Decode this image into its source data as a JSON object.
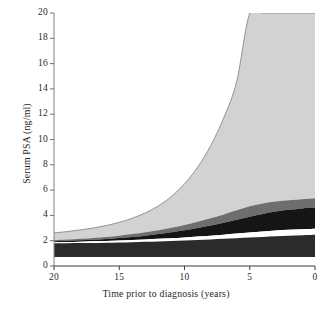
{
  "chart_data": {
    "type": "area",
    "title": "",
    "subtitle": "",
    "xlabel": "Time prior to diagnosis (years)",
    "ylabel": "Serum PSA (ng/ml)",
    "xlim": [
      20,
      0
    ],
    "ylim": [
      0,
      20
    ],
    "x_reversed": true,
    "grid": false,
    "legend": "none",
    "xticks": [
      "20",
      "15",
      "10",
      "5",
      "0"
    ],
    "xtick_values": [
      20,
      15,
      10,
      5,
      0
    ],
    "yticks": [
      "0",
      "2",
      "4",
      "6",
      "8",
      "10",
      "12",
      "14",
      "16",
      "18",
      "20"
    ],
    "ytick_values": [
      0,
      2,
      4,
      6,
      8,
      10,
      12,
      14,
      16,
      18,
      20
    ],
    "x": [
      20,
      19,
      18,
      17,
      16,
      15,
      14,
      13,
      12,
      11,
      10,
      9,
      8,
      7,
      6,
      5,
      4,
      3,
      2,
      1,
      0
    ],
    "series": [
      {
        "name": "upper-extreme-band-top",
        "color": "#d2d2d2",
        "values": [
          2.62,
          2.72,
          2.85,
          3.0,
          3.2,
          3.45,
          3.78,
          4.2,
          4.75,
          5.5,
          6.5,
          7.8,
          9.5,
          11.7,
          14.6,
          20.0,
          20.0,
          20.0,
          20.0,
          20.0,
          20.0
        ]
      },
      {
        "name": "upper-mid-band-top",
        "color": "#6e6e6e",
        "values": [
          2.05,
          2.1,
          2.16,
          2.22,
          2.3,
          2.4,
          2.52,
          2.66,
          2.83,
          3.02,
          3.25,
          3.5,
          3.78,
          4.08,
          4.4,
          4.72,
          4.95,
          5.1,
          5.2,
          5.28,
          5.35
        ]
      },
      {
        "name": "black-line-band-top",
        "color": "#151515",
        "values": [
          1.95,
          1.99,
          2.03,
          2.08,
          2.14,
          2.21,
          2.3,
          2.4,
          2.52,
          2.66,
          2.82,
          3.0,
          3.2,
          3.42,
          3.66,
          3.9,
          4.12,
          4.3,
          4.44,
          4.55,
          4.62
        ]
      },
      {
        "name": "white-gap-top",
        "color": "#ffffff",
        "values": [
          1.88,
          1.9,
          1.92,
          1.95,
          1.98,
          2.02,
          2.06,
          2.1,
          2.15,
          2.2,
          2.26,
          2.33,
          2.4,
          2.48,
          2.56,
          2.65,
          2.73,
          2.8,
          2.86,
          2.9,
          2.94
        ]
      },
      {
        "name": "lower-dark-band-top",
        "color": "#2b2b2b",
        "values": [
          1.8,
          1.8,
          1.81,
          1.82,
          1.84,
          1.86,
          1.88,
          1.91,
          1.94,
          1.98,
          2.02,
          2.06,
          2.1,
          2.15,
          2.2,
          2.25,
          2.3,
          2.35,
          2.4,
          2.44,
          2.48
        ]
      },
      {
        "name": "lower-dark-band-bottom",
        "color": "#2b2b2b",
        "values": [
          0.72,
          0.72,
          0.72,
          0.72,
          0.72,
          0.72,
          0.72,
          0.72,
          0.72,
          0.72,
          0.72,
          0.72,
          0.72,
          0.72,
          0.72,
          0.72,
          0.72,
          0.72,
          0.72,
          0.72,
          0.72
        ]
      }
    ],
    "colors": {
      "band_light_gray": "#d2d2d2",
      "band_mid_gray": "#6e6e6e",
      "band_black": "#151515",
      "band_dark": "#2b2b2b",
      "band_white_gap": "#ffffff",
      "axis": "#7a7a7a",
      "curve_outline": "#8a8a8a",
      "text": "#1f1f1f",
      "background": "#ffffff"
    }
  }
}
